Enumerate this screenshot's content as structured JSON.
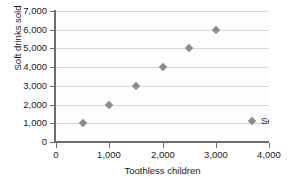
{
  "chart_data": {
    "type": "scatter",
    "title": "",
    "xlabel": "Toothless children",
    "ylabel": "Soft drinks sold",
    "xlim": [
      0,
      4000
    ],
    "ylim": [
      0,
      7000
    ],
    "grid": "horizontal",
    "legend_position": "inside-lower-right",
    "xticks": [
      "0",
      "1,000",
      "2,000",
      "3,000",
      "4,000"
    ],
    "xtick_values": [
      0,
      1000,
      2000,
      3000,
      4000
    ],
    "yticks": [
      "0",
      "1,000",
      "2,000",
      "3,000",
      "4,000",
      "5,000",
      "6,000",
      "7,000"
    ],
    "ytick_values": [
      0,
      1000,
      2000,
      3000,
      4000,
      5000,
      6000,
      7000
    ],
    "series": [
      {
        "name": "Series 1",
        "marker": "diamond",
        "color": "#8c8c8c",
        "x": [
          500,
          1000,
          1500,
          2000,
          2500,
          3000
        ],
        "y": [
          1000,
          2000,
          3000,
          4000,
          5000,
          6000
        ],
        "points": [
          {
            "x": 500,
            "y": 1000
          },
          {
            "x": 1000,
            "y": 2000
          },
          {
            "x": 1500,
            "y": 3000
          },
          {
            "x": 2000,
            "y": 4000
          },
          {
            "x": 2500,
            "y": 5000
          },
          {
            "x": 3000,
            "y": 6000
          }
        ]
      }
    ],
    "legend": [
      "Series 1"
    ],
    "colors": {
      "marker": "#8c8c8c",
      "gridline": "#d8d8d8",
      "axis": "#6e6e6e",
      "text": "#1a1a1a",
      "plot_background": "#fdfdfd"
    }
  }
}
